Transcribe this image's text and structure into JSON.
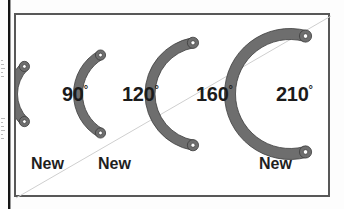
{
  "figure": {
    "type": "technical-diagram",
    "frame": {
      "border_color": "#585858",
      "background": "#ffffff"
    },
    "diagonal_line": {
      "name": "diagonal-crease-line",
      "color": "#cfcfcf",
      "from": "bottom-left",
      "to": "top-right"
    },
    "part_color": "#6e6e6e",
    "part_outline_color": "#3d3d3d",
    "hole_color": "#ffffff",
    "parts": [
      {
        "angle_label": "90",
        "degree_symbol": "°",
        "new_label": "New",
        "has_new_label": true,
        "cx": 36,
        "cy": 79,
        "r": 39,
        "band": 9,
        "start_deg": 135,
        "end_deg": 225
      },
      {
        "angle_label": "120",
        "degree_symbol": "°",
        "new_label": "New",
        "has_new_label": true,
        "cx": 107,
        "cy": 79,
        "r": 45,
        "band": 9,
        "start_deg": 120,
        "end_deg": 240
      },
      {
        "angle_label": "160",
        "degree_symbol": "°",
        "new_label": "",
        "has_new_label": false,
        "cx": 186,
        "cy": 79,
        "r": 52,
        "band": 10,
        "start_deg": 100,
        "end_deg": 260
      },
      {
        "angle_label": "210",
        "degree_symbol": "°",
        "new_label": "New",
        "has_new_label": true,
        "cx": 274,
        "cy": 79,
        "r": 60,
        "band": 11,
        "start_deg": 75,
        "end_deg": 285
      }
    ],
    "labels": {
      "deg_90": "90",
      "deg_120": "120",
      "deg_160": "160",
      "deg_210": "210",
      "degree_sign": "°",
      "new_1": "New",
      "new_2": "New",
      "new_3": "New"
    }
  }
}
